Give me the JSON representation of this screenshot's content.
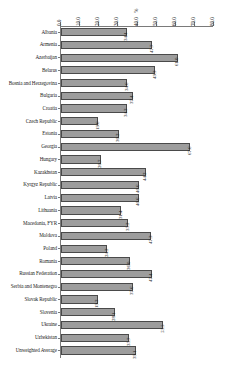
{
  "chart_data": {
    "type": "bar",
    "orientation": "horizontal",
    "title": "",
    "subtitle": "",
    "xlabel": "%",
    "ylabel": "",
    "xlim": [
      0.0,
      80.0
    ],
    "xticks": [
      "0.0",
      "10.0",
      "20.0",
      "30.0",
      "40.0",
      "50.0",
      "60.0",
      "70.0",
      "80.0"
    ],
    "xtick_values": [
      0,
      10,
      20,
      30,
      40,
      50,
      60,
      70,
      80
    ],
    "grid": false,
    "legend": null,
    "axis_unit_label": "%",
    "bar_color": "#9d9d9d",
    "bar_edge_color": "#4a4a4a",
    "categories": [
      "Albania",
      "Armenia",
      "Azerbaijan",
      "Belarus",
      "Bosnia and Herzegovina",
      "Bulgaria",
      "Croatia",
      "Czech Republic",
      "Estonia",
      "Georgia",
      "Hungary",
      "Kazakhstan",
      "Kyrgyz Republic",
      "Latvia",
      "Lithuania",
      "Macedonia, FYR",
      "Moldova",
      "Poland",
      "Romania",
      "Russian Federation",
      "Serbia and Montenegro",
      "Slovak Republic",
      "Slovenia",
      "Ukraine",
      "Uzbekistan",
      "Unweighted Average"
    ],
    "values": [
      34.4,
      47.7,
      61.0,
      49.3,
      34.6,
      37.4,
      34.3,
      19.6,
      30.2,
      67.6,
      20.7,
      44.2,
      40.6,
      40.6,
      31.4,
      35.2,
      47.3,
      24.2,
      36.0,
      47.4,
      37.6,
      19.3,
      28.1,
      53.5,
      35.7,
      39.1
    ],
    "value_labels": [
      "34.4",
      "47.7",
      "61.0",
      "49.3",
      "34.6",
      "37.4",
      "34.3",
      "19.6",
      "30.2",
      "67.6",
      "20.7",
      "44.2",
      "40.6",
      "40.6",
      "31.4",
      "35.2",
      "47.3",
      "24.2",
      "36.0",
      "47.4",
      "37.6",
      "19.3",
      "28.1",
      "53.5",
      "35.7",
      "39.1"
    ]
  }
}
